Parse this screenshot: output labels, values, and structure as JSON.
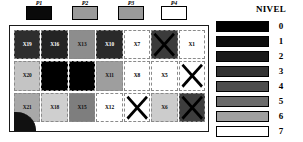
{
  "figure": {
    "legend_title": "NIVEL"
  },
  "ports": [
    {
      "label": "P1",
      "fill": "#0a0a0a",
      "left": 26,
      "width": 26
    },
    {
      "label": "P2",
      "fill": "#9a9a9a",
      "left": 72,
      "width": 26
    },
    {
      "label": "P3",
      "fill": "#9a9a9a",
      "left": 118,
      "width": 26
    },
    {
      "label": "P4",
      "fill": "#ffffff",
      "left": 161,
      "width": 26
    }
  ],
  "grid": {
    "rows": 3,
    "cols": 7,
    "cells": [
      {
        "label": "X19",
        "fill": "#2e2e2e",
        "text_color": "#ffffff",
        "crossed": false,
        "show_label": true
      },
      {
        "label": "X16",
        "fill": "#242424",
        "text_color": "#ffffff",
        "crossed": false,
        "show_label": true
      },
      {
        "label": "X13",
        "fill": "#8d8d8d",
        "text_color": "#111111",
        "crossed": false,
        "show_label": true
      },
      {
        "label": "X10",
        "fill": "#2a2a2a",
        "text_color": "#ffffff",
        "crossed": false,
        "show_label": true
      },
      {
        "label": "X7",
        "fill": "#ffffff",
        "text_color": "#000000",
        "crossed": false,
        "show_label": true
      },
      {
        "label": "X4",
        "fill": "#3b3b3b",
        "text_color": "#ffffff",
        "crossed": true,
        "show_label": false
      },
      {
        "label": "X1",
        "fill": "#ffffff",
        "text_color": "#000000",
        "crossed": false,
        "show_label": true
      },
      {
        "label": "X20",
        "fill": "#c4c4c4",
        "text_color": "#111111",
        "crossed": false,
        "show_label": true
      },
      {
        "label": "X17",
        "fill": "#000000",
        "text_color": "#ffffff",
        "crossed": false,
        "show_label": false
      },
      {
        "label": "X14",
        "fill": "#000000",
        "text_color": "#ffffff",
        "crossed": false,
        "show_label": false
      },
      {
        "label": "X11",
        "fill": "#9e9e9e",
        "text_color": "#111111",
        "crossed": false,
        "show_label": true
      },
      {
        "label": "X8",
        "fill": "#ffffff",
        "text_color": "#000000",
        "crossed": false,
        "show_label": true
      },
      {
        "label": "X5",
        "fill": "#ffffff",
        "text_color": "#000000",
        "crossed": false,
        "show_label": true
      },
      {
        "label": "X2",
        "fill": "#ffffff",
        "text_color": "#000000",
        "crossed": true,
        "show_label": false
      },
      {
        "label": "X21",
        "fill": "#a8a8a8",
        "text_color": "#111111",
        "crossed": false,
        "show_label": true
      },
      {
        "label": "X18",
        "fill": "#cfcfcf",
        "text_color": "#111111",
        "crossed": false,
        "show_label": true
      },
      {
        "label": "X15",
        "fill": "#7e7e7e",
        "text_color": "#111111",
        "crossed": false,
        "show_label": true
      },
      {
        "label": "X12",
        "fill": "#ffffff",
        "text_color": "#000000",
        "crossed": false,
        "show_label": true
      },
      {
        "label": "X9",
        "fill": "#ffffff",
        "text_color": "#000000",
        "crossed": true,
        "show_label": false
      },
      {
        "label": "X6",
        "fill": "#cccccc",
        "text_color": "#111111",
        "crossed": false,
        "show_label": true
      },
      {
        "label": "X3",
        "fill": "#3d3d3d",
        "text_color": "#ffffff",
        "crossed": true,
        "show_label": false
      }
    ]
  },
  "legend": {
    "entries": [
      {
        "level": "0",
        "fill": "#000000"
      },
      {
        "level": "1",
        "fill": "#0d0d0d"
      },
      {
        "level": "2",
        "fill": "#1a1a1a"
      },
      {
        "level": "3",
        "fill": "#333333"
      },
      {
        "level": "4",
        "fill": "#4d4d4d"
      },
      {
        "level": "5",
        "fill": "#6b6b6b"
      },
      {
        "level": "6",
        "fill": "#a0a0a0"
      },
      {
        "level": "7",
        "fill": "#ffffff"
      }
    ]
  }
}
